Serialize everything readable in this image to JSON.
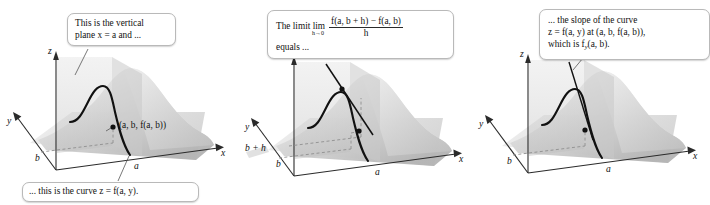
{
  "figure": {
    "panels": [
      {
        "id": "panel-1",
        "callouts": [
          {
            "name": "vertical-plane-callout",
            "line1": "This is the vertical",
            "line2": "plane x = a and ..."
          },
          {
            "name": "curve-callout",
            "text": "... this is the curve z = f(a, y)."
          }
        ],
        "axis_labels": {
          "z": "z",
          "y": "y",
          "x": "x"
        },
        "tick_labels": {
          "y_tick": "b",
          "x_tick": "a"
        },
        "point_label": "(a, b, f(a, b))"
      },
      {
        "id": "panel-2",
        "callouts": [
          {
            "name": "limit-callout",
            "lead": "The limit lim",
            "limit_subscript": "h→0",
            "numerator": "f(a, b + h) − f(a, b)",
            "denominator": "h",
            "tail": "equals ..."
          }
        ],
        "axis_labels": {
          "z": "z",
          "y": "y",
          "x": "x"
        },
        "tick_labels": {
          "y_tick_upper": "b + h",
          "y_tick_lower": "b",
          "x_tick": "a"
        }
      },
      {
        "id": "panel-3",
        "callouts": [
          {
            "name": "slope-callout",
            "line1": "... the slope of the curve",
            "line2": "z = f(a, y) at (a, b, f(a, b)),",
            "line3_pre": "which is f",
            "line3_sub": "y",
            "line3_post": "(a, b)."
          }
        ],
        "axis_labels": {
          "z": "z",
          "y": "y",
          "x": "x"
        },
        "tick_labels": {
          "y_tick": "b",
          "x_tick": "a"
        }
      }
    ],
    "colors": {
      "background": "#ffffff",
      "surface_light": "#f0f0f0",
      "surface_mid": "#d8d8d8",
      "surface_dark": "#b8b8b8",
      "plane_fill": "#cfcfcf",
      "floor_fill": "#e6e6e6",
      "curve_stroke": "#111111",
      "axis_stroke": "#2b2b2b",
      "dashed_stroke": "#8a8a8a",
      "callout_border": "#b9b9b9",
      "text": "#111111"
    }
  }
}
